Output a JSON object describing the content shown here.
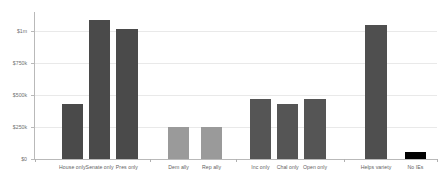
{
  "chart_data": {
    "type": "bar",
    "title": "",
    "subtitle": "",
    "xlabel": "",
    "ylabel": "",
    "ylim": [
      0,
      1150000
    ],
    "grid": true,
    "legend": "none",
    "ytick_labels": [
      "$0",
      "$250k",
      "$500k",
      "$750k",
      "$1m"
    ],
    "ytick_values": [
      0,
      250000,
      500000,
      750000,
      1000000
    ],
    "categories": [
      "House only",
      "Senate only",
      "Pres only",
      "Dem ally",
      "Rep ally",
      "Inc only",
      "Chal only",
      "Open only",
      "Helps variety",
      "No IEs"
    ],
    "values": [
      430000,
      1090000,
      1020000,
      253000,
      252000,
      470000,
      430000,
      470000,
      1050000,
      55000
    ],
    "bar_colors": [
      "#4a4a4a",
      "#4a4a4a",
      "#4a4a4a",
      "#9a9a9a",
      "#9a9a9a",
      "#555555",
      "#555555",
      "#555555",
      "#4f4f4f",
      "#000000"
    ],
    "groups": [
      {
        "name": "chamber",
        "members": [
          "House only",
          "Senate only",
          "Pres only"
        ]
      },
      {
        "name": "party-ally",
        "members": [
          "Dem ally",
          "Rep ally"
        ]
      },
      {
        "name": "candidate-status",
        "members": [
          "Inc only",
          "Chal only",
          "Open only"
        ]
      },
      {
        "name": "variety",
        "members": [
          "Helps variety",
          "No IEs"
        ]
      }
    ],
    "axis_color": "#b9b9b9",
    "grid_color": "#e9e9e9",
    "background": "#ffffff"
  }
}
